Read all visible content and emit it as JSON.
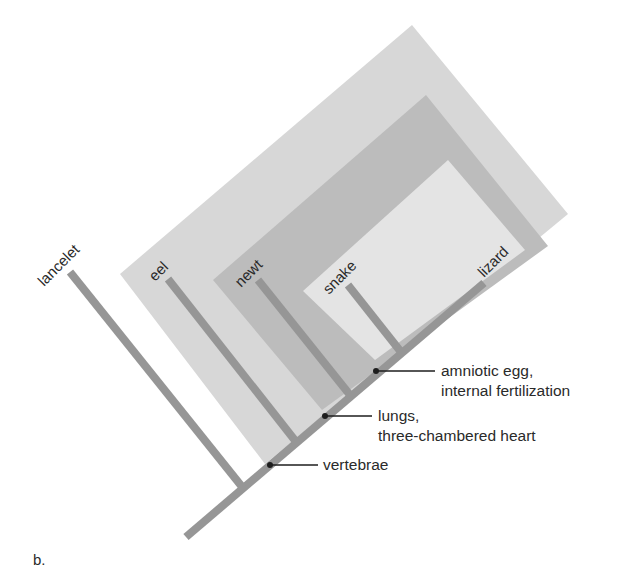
{
  "figure": {
    "panel_label": "b.",
    "type": "cladogram",
    "colors": {
      "background": "#ffffff",
      "clade_vertebrae": "#d7d7d7",
      "clade_lungs": "#bcbcbc",
      "clade_amniote": "#e4e4e4",
      "branch": "#969696",
      "annotation_line": "#1e1e1e",
      "text": "#2a2a2a"
    }
  },
  "taxa": [
    {
      "name": "lancelet"
    },
    {
      "name": "eel"
    },
    {
      "name": "newt"
    },
    {
      "name": "snake"
    },
    {
      "name": "lizard"
    }
  ],
  "traits": [
    {
      "id": "vertebrae",
      "lines": [
        "vertebrae"
      ]
    },
    {
      "id": "lungs",
      "lines": [
        "lungs,",
        "three-chambered heart"
      ]
    },
    {
      "id": "amniotic",
      "lines": [
        "amniotic egg,",
        "internal fertilization"
      ]
    }
  ],
  "clades": [
    {
      "id": "vertebrae-clade",
      "members": [
        "eel",
        "newt",
        "snake",
        "lizard"
      ]
    },
    {
      "id": "lungs-clade",
      "members": [
        "newt",
        "snake",
        "lizard"
      ]
    },
    {
      "id": "amniote-clade",
      "members": [
        "snake",
        "lizard"
      ]
    }
  ]
}
